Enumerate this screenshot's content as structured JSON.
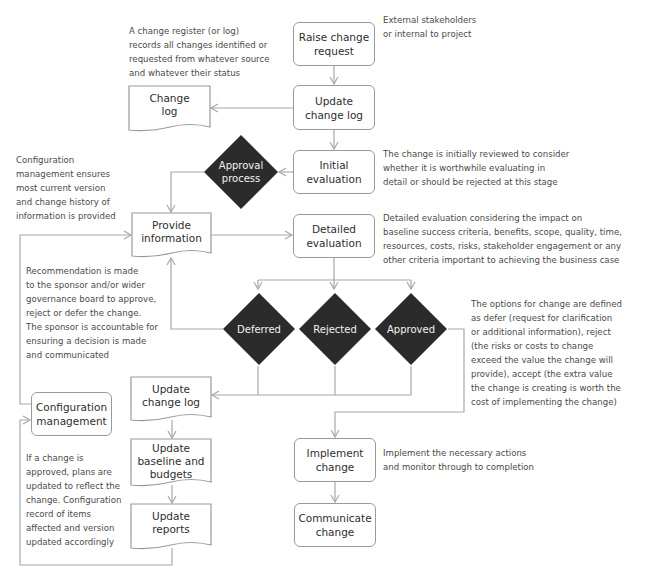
{
  "diagram": {
    "colors": {
      "line": "#a8a8a8",
      "box_border": "#9a9a9a",
      "diamond_fill": "#2b2b2b",
      "diamond_text": "#f2f2f2",
      "text": "#2e2e2e",
      "note_text": "#4a4a4a"
    },
    "nodes": {
      "raise_change_request": "Raise change\nrequest",
      "update_change_log_top": "Update\nchange log",
      "change_log": "Change\nlog",
      "approval_process": "Approval\nprocess",
      "initial_evaluation": "Initial\nevaluation",
      "provide_information": "Provide\ninformation",
      "detailed_evaluation": "Detailed\nevaluation",
      "deferred": "Deferred",
      "rejected": "Rejected",
      "approved": "Approved",
      "update_change_log_bottom": "Update\nchange log",
      "configuration_management": "Configuration\nmanagement",
      "update_baseline_and_budgets": "Update\nbaseline and\nbudgets",
      "update_reports": "Update\nreports",
      "implement_change": "Implement\nchange",
      "communicate_change": "Communicate\nchange"
    },
    "notes": {
      "change_register": "A change register (or log)\nrecords all changes identified or\nrequested from whatever source\nand whatever their status",
      "stakeholders": "External stakeholders\nor internal to project",
      "configuration": "Configuration\nmanagement ensures\nmost current version\nand change history of\ninformation is provided",
      "initial_review": "The change is initially reviewed to consider\nwhether it is worthwhile evaluating in\ndetail or should be rejected at this stage",
      "detailed_eval": "Detailed evaluation considering the impact on\nbaseline success criteria, benefits, scope, quality, time,\nresources, costs, risks, stakeholder engagement or any\nother criteria important to achieving the business case",
      "recommendation": "Recommendation is made\nto the sponsor and/or wider\ngovernance board to approve,\nreject or defer the change.\nThe sponsor is accountable for\nensuring a decision is made\nand communicated",
      "options": "The options for change are defined\nas defer (request for clarification\nor additional information), reject\n(the risks or costs to change\nexceed the value the change will\nprovide), accept (the extra value\nthe change is creating is worth the\ncost of implementing the change)",
      "approved_plans": "If a change is\napproved, plans are\nupdated to reflect the\nchange. Configuration\nrecord of items\naffected and version\nupdated accordingly",
      "implement": "Implement the necessary actions\nand monitor through to completion"
    }
  }
}
